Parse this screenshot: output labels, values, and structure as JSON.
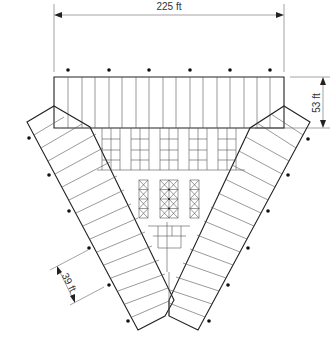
{
  "diagram": {
    "type": "parking-structure-plan",
    "dimensions": [
      {
        "id": "width",
        "label": "225 ft",
        "orientation": "horizontal"
      },
      {
        "id": "depth",
        "label": "53 ft",
        "orientation": "vertical"
      },
      {
        "id": "bay",
        "label": "39 ft",
        "orientation": "diagonal"
      }
    ],
    "elements": {
      "top_block_bays": 17,
      "wing_bays_each": 12,
      "columns": "dot markers"
    },
    "colors": {
      "line": "#222222",
      "background": "#ffffff"
    }
  }
}
